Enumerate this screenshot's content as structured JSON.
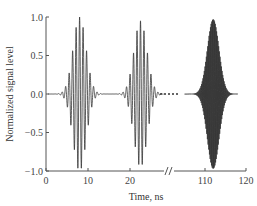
{
  "chart_data": {
    "type": "line",
    "title": "",
    "xlabel": "Time, ns",
    "ylabel": "Normalized signal level",
    "ylim": [
      -1.0,
      1.0
    ],
    "xlim_segments": [
      [
        0,
        28
      ],
      [
        105,
        120
      ]
    ],
    "axis_break": "//",
    "x_ticks": [
      "0",
      "10",
      "20",
      "110",
      "120"
    ],
    "y_ticks": [
      "1.0",
      "0.5",
      "0.0",
      "-0.5",
      "-1.0"
    ],
    "grid": false,
    "legend": null,
    "series": [
      {
        "name": "pulse 1",
        "center_ns": 8,
        "peak": 1.0,
        "width_ns": 3.5,
        "carrier_cycles_per_ns": 1.2
      },
      {
        "name": "pulse 2",
        "center_ns": 22.5,
        "peak": 0.95,
        "width_ns": 3.5,
        "carrier_cycles_per_ns": 1.2
      },
      {
        "name": "pulse 3",
        "center_ns": 112,
        "peak": 0.97,
        "width_ns": 3.2,
        "carrier_cycles_per_ns": 6
      }
    ],
    "line_color": "#333333"
  }
}
